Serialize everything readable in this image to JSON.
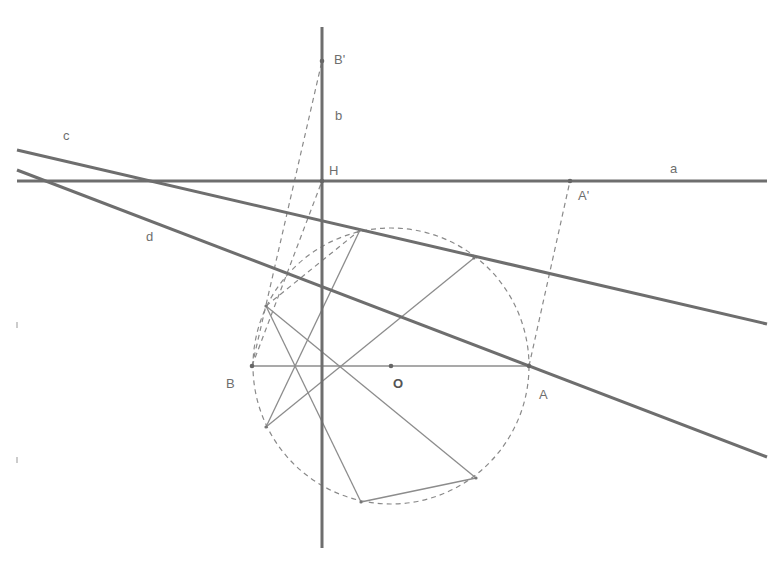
{
  "diagram": {
    "type": "geometry-construction",
    "colors": {
      "thick_line": "#6e6e6e",
      "thin_line": "#8c8c8c",
      "dashed": "#8a8a8a",
      "label": "#6e6e6e"
    },
    "lines": {
      "a": {
        "label": "a",
        "from": [
          17,
          181
        ],
        "to": [
          767,
          181
        ],
        "label_pos": [
          670,
          173
        ]
      },
      "b": {
        "label": "b",
        "from": [
          322,
          27
        ],
        "to": [
          322,
          548
        ],
        "label_pos": [
          335,
          120
        ]
      },
      "c": {
        "label": "c",
        "from": [
          17,
          150
        ],
        "to": [
          767,
          324
        ],
        "label_pos": [
          63,
          140
        ]
      },
      "d": {
        "label": "d",
        "from": [
          17,
          170
        ],
        "to": [
          767,
          457
        ],
        "label_pos": [
          146,
          241
        ]
      }
    },
    "circle": {
      "center": [
        391,
        366
      ],
      "radius": 138,
      "style": "dashed"
    },
    "points": {
      "O": {
        "label": "O",
        "pos": [
          391,
          366
        ],
        "label_pos": [
          393,
          388
        ]
      },
      "A": {
        "label": "A",
        "pos": [
          529,
          366
        ],
        "label_pos": [
          539,
          399
        ]
      },
      "B": {
        "label": "B",
        "pos": [
          252,
          366
        ],
        "label_pos": [
          226,
          388
        ]
      },
      "H": {
        "label": "H",
        "pos": [
          322,
          181
        ],
        "label_pos": [
          329,
          175
        ]
      },
      "A_prime": {
        "label": "A'",
        "pos": [
          570,
          181
        ],
        "label_pos": [
          578,
          200
        ]
      },
      "B_prime": {
        "label": "B'",
        "pos": [
          322,
          61
        ],
        "label_pos": [
          334,
          64
        ]
      }
    },
    "hexagon_points": [
      [
        266,
        306
      ],
      [
        360,
        230
      ],
      [
        474,
        258
      ],
      [
        266,
        427
      ],
      [
        361,
        502
      ],
      [
        476,
        478
      ]
    ],
    "thin_segments": [
      {
        "from": [
          252,
          366
        ],
        "to": [
          529,
          366
        ]
      },
      {
        "from": [
          266,
          306
        ],
        "to": [
          476,
          478
        ]
      },
      {
        "from": [
          266,
          306
        ],
        "to": [
          361,
          502
        ]
      },
      {
        "from": [
          266,
          427
        ],
        "to": [
          474,
          258
        ]
      },
      {
        "from": [
          266,
          427
        ],
        "to": [
          360,
          230
        ]
      },
      {
        "from": [
          361,
          502
        ],
        "to": [
          476,
          478
        ]
      }
    ],
    "dashed_segments": [
      {
        "from": [
          252,
          366
        ],
        "to": [
          322,
          61
        ]
      },
      {
        "from": [
          252,
          366
        ],
        "to": [
          322,
          181
        ]
      },
      {
        "from": [
          529,
          366
        ],
        "to": [
          570,
          181
        ]
      },
      {
        "from": [
          266,
          306
        ],
        "to": [
          360,
          230
        ]
      }
    ],
    "ticks": [
      [
        17,
        325
      ],
      [
        17,
        460
      ]
    ]
  }
}
